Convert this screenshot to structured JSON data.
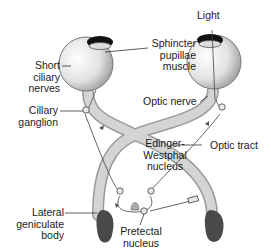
{
  "diagram": {
    "labels": {
      "light": "Light",
      "sphincter": [
        "Sphincter",
        "pupillae",
        "muscle"
      ],
      "short_ciliary": [
        "Short",
        "ciliary",
        "nerves"
      ],
      "ciliary_ganglion": [
        "Cillary",
        "ganglion"
      ],
      "optic_nerve": "Optic nerve",
      "edinger": [
        "Edinger-",
        "Westphal",
        "nucleus"
      ],
      "optic_tract": "Optic tract",
      "lateral_geniculate": [
        "Lateral",
        "geniculate",
        "body"
      ],
      "pretectal": [
        "Pretectal",
        "nucleus"
      ]
    },
    "colors": {
      "nerve": "#c8c8c8",
      "nerve_edge": "#9a9a9a",
      "eye": "#d9d9d9",
      "lgb": "#4a4a4a",
      "line": "#555555"
    }
  }
}
